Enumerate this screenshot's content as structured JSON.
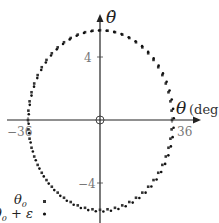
{
  "chart_data": {
    "type": "scatter",
    "title": "",
    "xlabel": "θ (deg)",
    "ylabel": "θ̇",
    "xlim": [
      -50,
      53
    ],
    "ylim": [
      -6.5,
      7.5
    ],
    "x_ticks": [
      -36,
      36
    ],
    "x_tick_labels": [
      "−36",
      "36"
    ],
    "y_ticks": [
      4,
      -4
    ],
    "y_tick_labels": [
      "4",
      "−4"
    ],
    "grid": false,
    "legend_position": "lower-left",
    "origin_marker": "circle",
    "series": [
      {
        "name": "θ₀",
        "marker": "square",
        "shape": "ellipse",
        "center": [
          0,
          0
        ],
        "x_amplitude": 36,
        "y_amplitude": 5.7,
        "points": 60
      },
      {
        "name": "θ₀ + ε",
        "marker": "dot",
        "shape": "ellipse",
        "center": [
          0,
          0
        ],
        "x_amplitude": 36.3,
        "y_amplitude": 5.75,
        "points": 60
      }
    ]
  },
  "legend": {
    "items": [
      {
        "label_main": "θ",
        "label_sub": "0",
        "suffix": ""
      },
      {
        "label_main": "θ",
        "label_sub": "0",
        "suffix": " + ε"
      }
    ]
  },
  "axes": {
    "x_label_symbol": "θ",
    "x_label_unit": "(deg)",
    "y_label_symbol": "θ̇",
    "x_tick_neg": "−36",
    "x_tick_pos": "36",
    "y_tick_pos": "4",
    "y_tick_neg": "−4"
  }
}
